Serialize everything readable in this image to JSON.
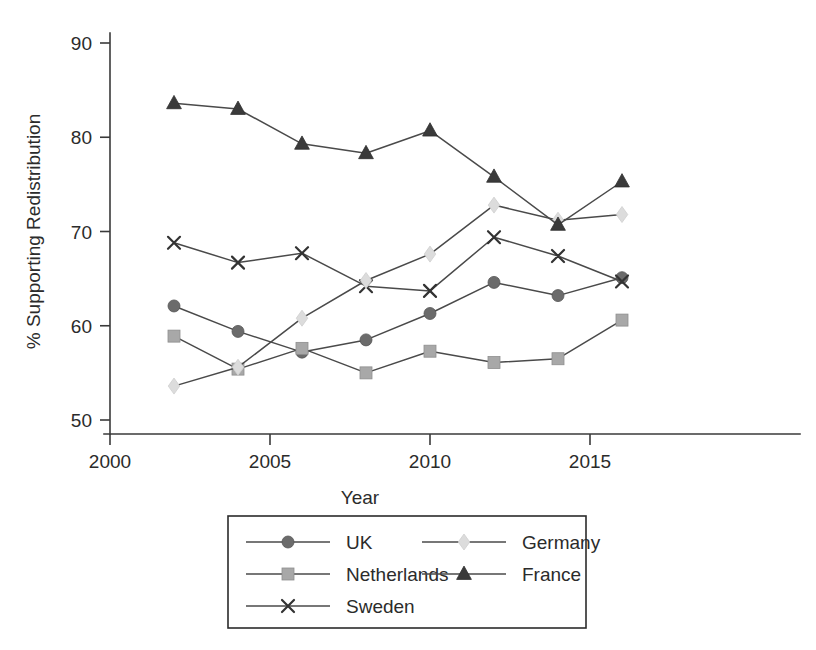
{
  "chart_data": {
    "type": "line",
    "title": "",
    "xlabel": "Year",
    "ylabel": "% Supporting Redistribution",
    "xlim": [
      2000,
      2017
    ],
    "ylim": [
      48,
      92
    ],
    "xticks": [
      2000,
      2005,
      2010,
      2015
    ],
    "xtick_labels": [
      "2000",
      "2005",
      "2010",
      "2015"
    ],
    "yticks": [
      50,
      60,
      70,
      80,
      90
    ],
    "ytick_labels": [
      "50",
      "60",
      "70",
      "80",
      "90"
    ],
    "grid": false,
    "legend_position": "below-center",
    "x": [
      2002,
      2004,
      2006,
      2008,
      2010,
      2012,
      2014,
      2016
    ],
    "series": [
      {
        "name": "UK",
        "marker": "circle",
        "color": "#6b6b6b",
        "line_color": "#4a4a4a",
        "values": [
          62.1,
          59.4,
          57.2,
          58.5,
          61.3,
          64.6,
          63.2,
          65.1
        ]
      },
      {
        "name": "Netherlands",
        "marker": "square",
        "color": "#a8a8a8",
        "line_color": "#4a4a4a",
        "values": [
          58.9,
          55.4,
          57.6,
          55.0,
          57.3,
          56.1,
          56.5,
          60.6
        ]
      },
      {
        "name": "Sweden",
        "marker": "cross",
        "color": "#333333",
        "line_color": "#4a4a4a",
        "values": [
          68.8,
          66.7,
          67.7,
          64.2,
          63.7,
          69.4,
          67.4,
          64.7
        ]
      },
      {
        "name": "Germany",
        "marker": "diamond",
        "color": "#dcdcdc",
        "line_color": "#4a4a4a",
        "values": [
          53.6,
          55.6,
          60.8,
          64.8,
          67.6,
          72.8,
          71.2,
          71.8
        ]
      },
      {
        "name": "France",
        "marker": "triangle",
        "color": "#3a3a3a",
        "line_color": "#4a4a4a",
        "values": [
          83.6,
          83.0,
          79.3,
          78.3,
          80.7,
          75.8,
          70.7,
          75.3
        ]
      }
    ]
  },
  "legend": {
    "entries": [
      {
        "label": "UK",
        "marker": "circle"
      },
      {
        "label": "Germany",
        "marker": "diamond"
      },
      {
        "label": "Netherlands",
        "marker": "square"
      },
      {
        "label": "France",
        "marker": "triangle"
      },
      {
        "label": "Sweden",
        "marker": "cross"
      }
    ]
  }
}
